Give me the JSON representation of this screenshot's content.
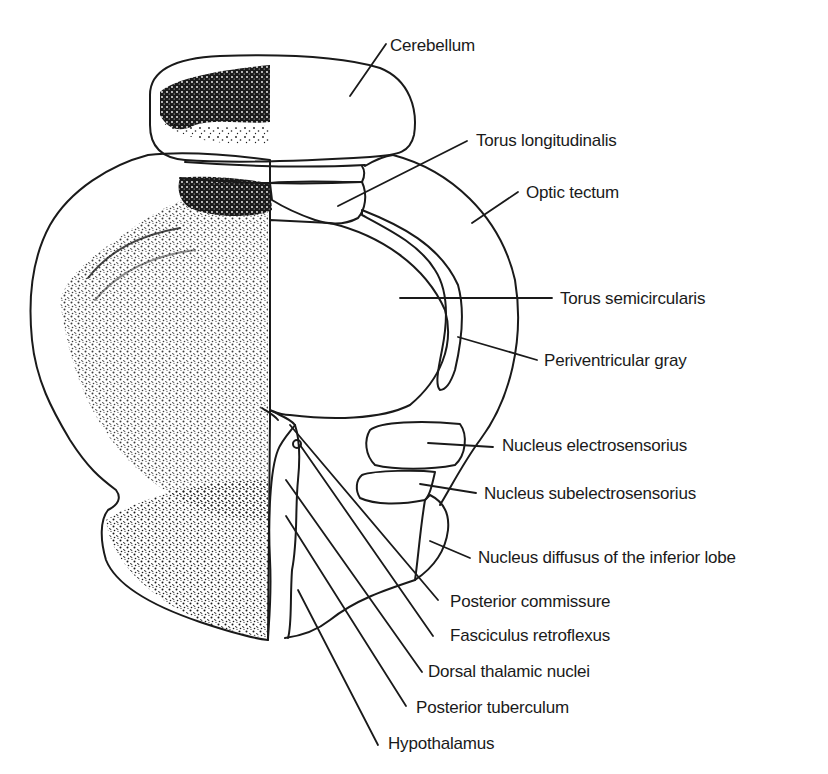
{
  "diagram": {
    "type": "anatomical-section",
    "colors": {
      "ink": "#1a1a1a",
      "background": "#ffffff"
    },
    "labels": [
      {
        "id": "cerebellum",
        "text": "Cerebellum"
      },
      {
        "id": "torus-longitudinalis",
        "text": "Torus longitudinalis"
      },
      {
        "id": "optic-tectum",
        "text": "Optic tectum"
      },
      {
        "id": "torus-semicircularis",
        "text": "Torus semicircularis"
      },
      {
        "id": "periventricular-gray",
        "text": "Periventricular gray"
      },
      {
        "id": "nucleus-electrosensorius",
        "text": "Nucleus electrosensorius"
      },
      {
        "id": "nucleus-subelectrosensorius",
        "text": "Nucleus subelectrosensorius"
      },
      {
        "id": "nucleus-diffusus",
        "text": "Nucleus diffusus of the inferior lobe"
      },
      {
        "id": "posterior-commissure",
        "text": "Posterior commissure"
      },
      {
        "id": "fasciculus-retroflexus",
        "text": "Fasciculus retroflexus"
      },
      {
        "id": "dorsal-thalamic-nuclei",
        "text": "Dorsal thalamic nuclei"
      },
      {
        "id": "posterior-tuberculum",
        "text": "Posterior tuberculum"
      },
      {
        "id": "hypothalamus",
        "text": "Hypothalamus"
      }
    ]
  }
}
